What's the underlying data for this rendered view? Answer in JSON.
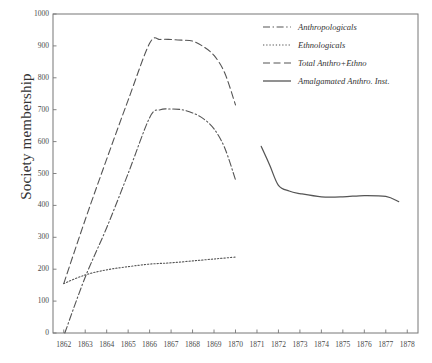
{
  "chart_data": {
    "type": "line",
    "title": "",
    "xlabel": "",
    "ylabel": "Society membership",
    "xlim": [
      1861.5,
      1878.5
    ],
    "ylim": [
      0,
      1000
    ],
    "ytick_labels": [
      "0",
      "100",
      "200",
      "300",
      "400",
      "500",
      "600",
      "700",
      "800",
      "900",
      "1000"
    ],
    "ytick_values": [
      0,
      100,
      200,
      300,
      400,
      500,
      600,
      700,
      800,
      900,
      1000
    ],
    "xtick_labels": [
      "1862",
      "1863",
      "1864",
      "1865",
      "1866",
      "1867",
      "1868",
      "1869",
      "1870",
      "1871",
      "1872",
      "1873",
      "1874",
      "1875",
      "1876",
      "1877",
      "1878"
    ],
    "xtick_values": [
      1862,
      1863,
      1864,
      1865,
      1866,
      1867,
      1868,
      1869,
      1870,
      1871,
      1872,
      1873,
      1874,
      1875,
      1876,
      1877,
      1878
    ],
    "grid": false,
    "legend_position": "top-right",
    "line_color": "#555555",
    "axis_color": "#777777",
    "background": "#ffffff",
    "series": [
      {
        "name": "Anthropologicals",
        "style": "dashdot",
        "x": [
          1862.05,
          1863,
          1864,
          1865,
          1866,
          1866.5,
          1867,
          1867.5,
          1868,
          1868.5,
          1869,
          1869.5,
          1870
        ],
        "y": [
          0,
          175,
          330,
          500,
          675,
          700,
          702,
          700,
          690,
          672,
          640,
          580,
          480
        ]
      },
      {
        "name": "Ethnologicals",
        "style": "dotted",
        "x": [
          1862,
          1863,
          1864,
          1865,
          1866,
          1867,
          1868,
          1869,
          1870
        ],
        "y": [
          155,
          182,
          198,
          208,
          216,
          220,
          226,
          232,
          238
        ]
      },
      {
        "name": "Total Anthro+Ethno",
        "style": "dashed",
        "x": [
          1862,
          1863,
          1864,
          1865,
          1866,
          1866.5,
          1867,
          1867.5,
          1868,
          1868.5,
          1869,
          1869.5,
          1870
        ],
        "y": [
          155,
          355,
          545,
          730,
          908,
          920,
          920,
          918,
          915,
          898,
          870,
          815,
          715
        ]
      },
      {
        "name": "Amalgamated Anthro. Inst.",
        "style": "solid",
        "x": [
          1871.2,
          1871.6,
          1872,
          1872.5,
          1873,
          1874,
          1875,
          1876,
          1877,
          1877.6
        ],
        "y": [
          585,
          525,
          463,
          445,
          437,
          427,
          427,
          431,
          428,
          412
        ]
      }
    ]
  },
  "legend": {
    "items": [
      {
        "label": "Anthropologicals",
        "style": "dashdot"
      },
      {
        "label": "Ethnologicals",
        "style": "dotted"
      },
      {
        "label": "Total Anthro+Ethno",
        "style": "dashed"
      },
      {
        "label": "Amalgamated Anthro. Inst.",
        "style": "solid"
      }
    ]
  }
}
